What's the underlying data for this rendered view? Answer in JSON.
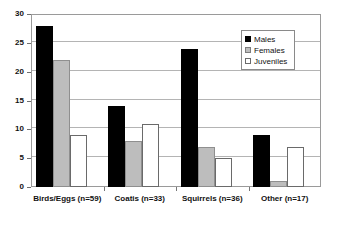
{
  "chart_data": {
    "type": "bar",
    "title": "",
    "xlabel": "",
    "ylabel": "",
    "ylim": [
      0,
      30
    ],
    "yticks": [
      0,
      5,
      10,
      15,
      20,
      25,
      30
    ],
    "grid": true,
    "legend_position": "top-right",
    "categories": [
      "Birds/Eggs (n=59)",
      "Coatis (n=33)",
      "Squirrels (n=36)",
      "Other (n=17)"
    ],
    "series": [
      {
        "name": "Males",
        "color": "#000000",
        "values": [
          28,
          14,
          24,
          9
        ]
      },
      {
        "name": "Females",
        "color": "#bdbdbd",
        "values": [
          22,
          8,
          7,
          1
        ]
      },
      {
        "name": "Juveniles",
        "color": "#ffffff",
        "values": [
          9,
          11,
          5,
          7
        ]
      }
    ]
  },
  "legend": {
    "items": [
      {
        "label": "Males",
        "swatch": "filled-black-square-icon"
      },
      {
        "label": "Females",
        "swatch": "filled-gray-square-icon"
      },
      {
        "label": "Juveniles",
        "swatch": "open-white-square-icon"
      }
    ]
  },
  "axes": {
    "y_tick_labels": [
      "0",
      "5",
      "10",
      "15",
      "20",
      "25",
      "30"
    ]
  }
}
